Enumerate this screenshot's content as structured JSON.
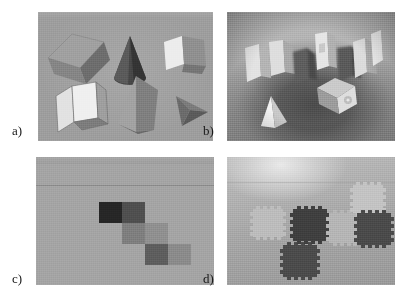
{
  "figure": {
    "kind": "four-panel-comparison-figure",
    "background_color": "#ffffff",
    "panel_labels": [
      "a)",
      "b)",
      "c)",
      "d)"
    ]
  },
  "panels": [
    {
      "id": "a",
      "label": "a)",
      "type": "rendered-synthetic-scene",
      "background_color": "#9d9d9d",
      "window_strip": {
        "left_text": "",
        "center_text": "",
        "right_text": ""
      },
      "objects": [
        {
          "name": "cuboid-top-left",
          "shape": "box",
          "fill": "#8e8e8e",
          "shade": "#6f6f6f"
        },
        {
          "name": "cone-top-center",
          "shape": "cone",
          "fill": "#4b4b4b",
          "shade": "#3a3a3a"
        },
        {
          "name": "cube-top-right",
          "shape": "cube",
          "fill": "#e7e7e7",
          "shade": "#8b8b8b"
        },
        {
          "name": "box-bottom-left",
          "shape": "box",
          "fill": "#e0e0e0",
          "shade": "#9c9c9c"
        },
        {
          "name": "prism-bottom-center",
          "shape": "triangular-prism",
          "fill": "#9a9a9a",
          "shade": "#6a6a6a"
        },
        {
          "name": "tetrahedron-bottom-right",
          "shape": "tetrahedron",
          "fill": "#6e6e6e",
          "shade": "#4f4f4f"
        }
      ]
    },
    {
      "id": "b",
      "label": "b)",
      "type": "real-photograph-scene",
      "background_color": "#7b7b7b",
      "objects": [
        {
          "name": "white-block-left",
          "shape": "box"
        },
        {
          "name": "white-block-left-inner",
          "shape": "box"
        },
        {
          "name": "dark-block-center-left",
          "shape": "box"
        },
        {
          "name": "white-block-center",
          "shape": "box"
        },
        {
          "name": "dark-block-center-right",
          "shape": "box"
        },
        {
          "name": "white-block-right",
          "shape": "box"
        },
        {
          "name": "white-block-far-right",
          "shape": "box"
        },
        {
          "name": "pyramid-front-left",
          "shape": "pyramid"
        },
        {
          "name": "dice-cube-front-right",
          "shape": "cube"
        }
      ]
    },
    {
      "id": "c",
      "label": "c)",
      "type": "rendered-tile-staircase",
      "background_color": "#a3a3a3",
      "window_strip": {
        "left_text": "",
        "center_text": "",
        "right_text": ""
      },
      "tiles": [
        {
          "name": "tile-1",
          "fill": "#262626",
          "row": 0,
          "col": 0
        },
        {
          "name": "tile-2",
          "fill": "#4f4f4f",
          "row": 0,
          "col": 1
        },
        {
          "name": "tile-3",
          "fill": "#7e7e7e",
          "row": 1,
          "col": 1
        },
        {
          "name": "tile-4",
          "fill": "#8f8f8f",
          "row": 1,
          "col": 2
        },
        {
          "name": "tile-5",
          "fill": "#5d5d5d",
          "row": 2,
          "col": 2
        },
        {
          "name": "tile-6",
          "fill": "#8a8a8a",
          "row": 2,
          "col": 3
        }
      ]
    },
    {
      "id": "d",
      "label": "d)",
      "type": "real-photograph-tiles",
      "background_color": "#a8a8a8",
      "tiles": [
        {
          "name": "tile-1",
          "fill": "#b9b9b9",
          "tone": "light"
        },
        {
          "name": "tile-2",
          "fill": "#4d4d4d",
          "tone": "dark"
        },
        {
          "name": "tile-3",
          "fill": "#3f3f3f",
          "tone": "dark"
        },
        {
          "name": "tile-4",
          "fill": "#b5b5b5",
          "tone": "light"
        },
        {
          "name": "tile-5",
          "fill": "#c2c2c2",
          "tone": "light"
        },
        {
          "name": "tile-6",
          "fill": "#4a4a4a",
          "tone": "dark"
        }
      ]
    }
  ]
}
